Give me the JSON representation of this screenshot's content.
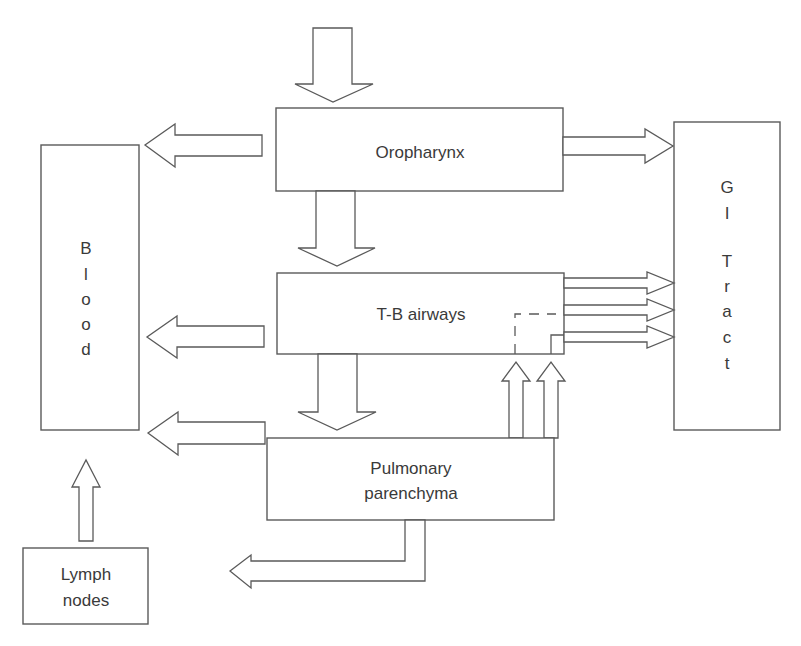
{
  "diagram": {
    "nodes": {
      "oropharynx": {
        "label": "Oropharynx"
      },
      "tb_airways": {
        "label": "T-B airways"
      },
      "pulmonary": {
        "line1": "Pulmonary",
        "line2": "parenchyma"
      },
      "blood": {
        "letters": [
          "B",
          "l",
          "o",
          "o",
          "d"
        ]
      },
      "gi_tract": {
        "letters": [
          "G",
          "I",
          "T",
          "r",
          "a",
          "c",
          "t"
        ]
      },
      "lymph": {
        "line1": "Lymph",
        "line2": "nodes"
      }
    },
    "edges": [
      {
        "from": "external",
        "to": "oropharynx"
      },
      {
        "from": "oropharynx",
        "to": "blood"
      },
      {
        "from": "oropharynx",
        "to": "gi_tract"
      },
      {
        "from": "oropharynx",
        "to": "tb_airways"
      },
      {
        "from": "tb_airways",
        "to": "blood"
      },
      {
        "from": "tb_airways",
        "to": "gi_tract",
        "count": 3
      },
      {
        "from": "tb_airways",
        "to": "pulmonary"
      },
      {
        "from": "pulmonary",
        "to": "tb_airways",
        "count": 2
      },
      {
        "from": "pulmonary",
        "to": "blood"
      },
      {
        "from": "pulmonary",
        "to": "lymph_outflow"
      },
      {
        "from": "lymph",
        "to": "blood"
      }
    ],
    "colors": {
      "stroke": "#5a5a5a",
      "text": "#3a3a3a",
      "background": "#ffffff"
    }
  }
}
